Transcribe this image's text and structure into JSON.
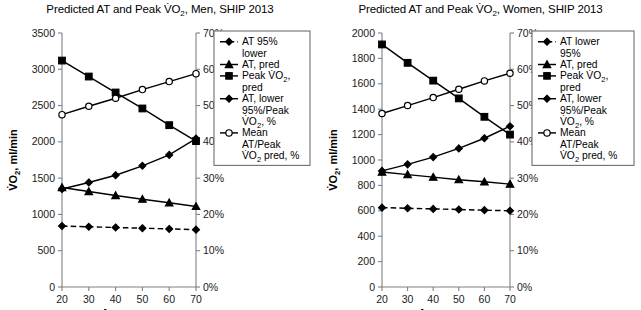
{
  "figure": {
    "width": 641,
    "height": 310,
    "background": "#ffffff",
    "axis_color": "#808080",
    "series_color": "#000000"
  },
  "panels": [
    {
      "id": "men",
      "title": "Predicted AT and Peak V̇O2, Men, SHIP 2013",
      "title_prefix": "Predicted AT and Peak V̇O",
      "title_sub": "2",
      "title_suffix": ", Men, SHIP 2013",
      "xlabel": "Age, years",
      "ylabel_prefix": "V̇O",
      "ylabel_sub": "2",
      "ylabel_suffix": ", ml/min",
      "legend": [
        {
          "label_lines": [
            "AT 95%",
            "lower"
          ],
          "marker": "diamond",
          "fill": "filled",
          "dash": true
        },
        {
          "label_lines": [
            "AT, pred"
          ],
          "marker": "triangle",
          "fill": "filled",
          "dash": false
        },
        {
          "label_lines": [
            "Peak V̇O2,",
            "pred"
          ],
          "marker": "square",
          "fill": "filled",
          "dash": false
        },
        {
          "label_lines": [
            "AT, lower",
            "95%/Peak",
            "V̇O2, %"
          ],
          "marker": "diamond",
          "fill": "filled",
          "dash": false
        },
        {
          "label_lines": [
            "Mean",
            "AT/Peak",
            "V̇O2 pred, %"
          ],
          "marker": "circle",
          "fill": "open",
          "dash": false
        }
      ]
    },
    {
      "id": "women",
      "title": "Predicted AT and Peak V̇O2, Women, SHIP 2013",
      "title_prefix": "Predicted AT and Peak V̇O",
      "title_sub": "2",
      "title_suffix": ", Women, SHIP 2013",
      "xlabel": "Age, years",
      "ylabel_prefix": "V̇O",
      "ylabel_sub": "2",
      "ylabel_suffix": ", ml/min",
      "legend": [
        {
          "label_lines": [
            "AT lower",
            "95%"
          ],
          "marker": "diamond",
          "fill": "filled",
          "dash": true
        },
        {
          "label_lines": [
            "AT, pred"
          ],
          "marker": "triangle",
          "fill": "filled",
          "dash": false
        },
        {
          "label_lines": [
            "Peak V̇O2,",
            "pred"
          ],
          "marker": "square",
          "fill": "filled",
          "dash": false
        },
        {
          "label_lines": [
            "AT, lower",
            "95%/Peak",
            "V̇O2, %"
          ],
          "marker": "diamond",
          "fill": "filled",
          "dash": false
        },
        {
          "label_lines": [
            "Mean",
            "AT/Peak",
            "V̇O2 pred, %"
          ],
          "marker": "circle",
          "fill": "open",
          "dash": false
        }
      ]
    }
  ],
  "chart_data": [
    {
      "type": "line",
      "id": "men",
      "title": "Predicted AT and Peak VO2, Men, SHIP 2013",
      "xlabel": "Age, years",
      "ylabel": "VO2, ml/min",
      "y2label": "",
      "x": [
        20,
        30,
        40,
        50,
        60,
        70
      ],
      "xlim": [
        20,
        70
      ],
      "xticks": [
        20,
        30,
        40,
        50,
        60,
        70
      ],
      "xticklabels": [
        "20",
        "30",
        "40",
        "50",
        "60",
        "70"
      ],
      "ylim": [
        0,
        3500
      ],
      "yticks": [
        0,
        500,
        1000,
        1500,
        2000,
        2500,
        3000,
        3500
      ],
      "yticklabels": [
        "0",
        "500",
        "1000",
        "1500",
        "2000",
        "2500",
        "3000",
        "3500"
      ],
      "y2lim": [
        0,
        70
      ],
      "y2ticks": [
        0,
        10,
        20,
        30,
        40,
        50,
        60,
        70
      ],
      "y2ticklabels": [
        "0%",
        "10%",
        "20%",
        "30%",
        "40%",
        "50%",
        "60%",
        "70%"
      ],
      "grid": false,
      "legend_position": "right-outside",
      "series": [
        {
          "name": "AT 95% lower",
          "axis": "left",
          "marker": "diamond",
          "fill": "filled",
          "dash": true,
          "values": [
            840,
            830,
            820,
            810,
            800,
            790
          ]
        },
        {
          "name": "AT, pred",
          "axis": "left",
          "marker": "triangle",
          "fill": "filled",
          "dash": false,
          "values": [
            1370,
            1315,
            1260,
            1210,
            1160,
            1110
          ]
        },
        {
          "name": "Peak VO2, pred",
          "axis": "left",
          "marker": "square",
          "fill": "filled",
          "dash": false,
          "values": [
            3120,
            2900,
            2680,
            2460,
            2230,
            2010
          ]
        },
        {
          "name": "AT, lower 95%/Peak VO2, %",
          "axis": "right",
          "marker": "diamond",
          "fill": "filled",
          "dash": false,
          "values": [
            27.0,
            28.8,
            30.8,
            33.4,
            36.4,
            40.9
          ]
        },
        {
          "name": "Mean AT/Peak VO2 pred, %",
          "axis": "right",
          "marker": "circle",
          "fill": "open",
          "dash": false,
          "values": [
            47.5,
            49.8,
            52.0,
            54.4,
            56.6,
            58.8
          ]
        }
      ]
    },
    {
      "type": "line",
      "id": "women",
      "title": "Predicted AT and Peak VO2, Women, SHIP 2013",
      "xlabel": "Age, years",
      "ylabel": "VO2, ml/min",
      "y2label": "",
      "x": [
        20,
        30,
        40,
        50,
        60,
        70
      ],
      "xlim": [
        20,
        70
      ],
      "xticks": [
        20,
        30,
        40,
        50,
        60,
        70
      ],
      "xticklabels": [
        "20",
        "30",
        "40",
        "50",
        "60",
        "70"
      ],
      "ylim": [
        0,
        2000
      ],
      "yticks": [
        0,
        200,
        400,
        600,
        800,
        1000,
        1200,
        1400,
        1600,
        1800,
        2000
      ],
      "yticklabels": [
        "0",
        "200",
        "400",
        "600",
        "800",
        "1000",
        "1200",
        "1400",
        "1600",
        "1800",
        "2000"
      ],
      "y2lim": [
        0,
        70
      ],
      "y2ticks": [
        0,
        10,
        20,
        30,
        40,
        50,
        60,
        70
      ],
      "y2ticklabels": [
        "0%",
        "10%",
        "20%",
        "30%",
        "40%",
        "50%",
        "60%",
        "70%"
      ],
      "grid": false,
      "legend_position": "right-outside",
      "series": [
        {
          "name": "AT lower 95%",
          "axis": "left",
          "marker": "diamond",
          "fill": "filled",
          "dash": true,
          "values": [
            625,
            620,
            615,
            610,
            605,
            600
          ]
        },
        {
          "name": "AT, pred",
          "axis": "left",
          "marker": "triangle",
          "fill": "filled",
          "dash": false,
          "values": [
            905,
            885,
            865,
            845,
            828,
            810
          ]
        },
        {
          "name": "Peak VO2, pred",
          "axis": "left",
          "marker": "square",
          "fill": "filled",
          "dash": false,
          "values": [
            1910,
            1765,
            1625,
            1485,
            1340,
            1200
          ]
        },
        {
          "name": "AT, lower 95%/Peak VO2, %",
          "axis": "right",
          "marker": "diamond",
          "fill": "filled",
          "dash": false,
          "values": [
            32.0,
            33.8,
            35.8,
            38.2,
            41.0,
            44.3
          ]
        },
        {
          "name": "Mean AT/Peak VO2 pred, %",
          "axis": "right",
          "marker": "circle",
          "fill": "open",
          "dash": false,
          "values": [
            47.8,
            50.0,
            52.2,
            54.5,
            56.8,
            58.9
          ]
        }
      ]
    }
  ]
}
